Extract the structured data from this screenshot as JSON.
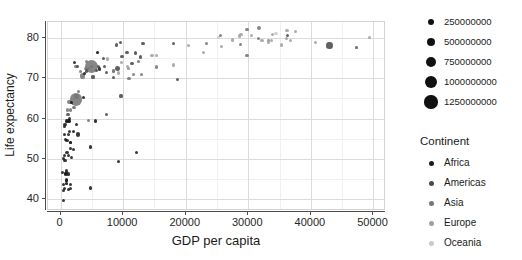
{
  "chart_data": {
    "type": "scatter",
    "title": "",
    "xlabel": "GDP per capita",
    "ylabel": "Life expectancy",
    "xlim": [
      -2000,
      52000
    ],
    "ylim": [
      37,
      84
    ],
    "xticks": [
      0,
      10000,
      20000,
      30000,
      40000,
      50000
    ],
    "xtick_labels": [
      "0",
      "10000",
      "20000",
      "30000",
      "40000",
      "50000"
    ],
    "yticks": [
      40,
      50,
      60,
      70,
      80
    ],
    "ytick_labels": [
      "40",
      "50",
      "60",
      "70",
      "80"
    ],
    "grid": true,
    "minor_grid": true,
    "legend_position": "right",
    "size_encoding": "population",
    "color_encoding": "continent",
    "series": [
      {
        "name": "Africa",
        "color": "#1a1a1a",
        "points": [
          {
            "x": 975,
            "y": 43.8,
            "pop": 31889923
          },
          {
            "x": 5937,
            "y": 76.4,
            "pop": 3600523
          },
          {
            "x": 6223,
            "y": 72.3,
            "pop": 33333216
          },
          {
            "x": 4797,
            "y": 42.7,
            "pop": 12420476
          },
          {
            "x": 1441,
            "y": 56.7,
            "pop": 8078314
          },
          {
            "x": 1217,
            "y": 50.7,
            "pop": 14326203
          },
          {
            "x": 430,
            "y": 50.0,
            "pop": 8390505
          },
          {
            "x": 2042,
            "y": 52.3,
            "pop": 17696293
          },
          {
            "x": 706,
            "y": 49.6,
            "pop": 4369038
          },
          {
            "x": 1704,
            "y": 50.4,
            "pop": 10238807
          },
          {
            "x": 986,
            "y": 44.7,
            "pop": 710960
          },
          {
            "x": 277,
            "y": 46.5,
            "pop": 64606759
          },
          {
            "x": 3632,
            "y": 65.2,
            "pop": 3800610
          },
          {
            "x": 1544,
            "y": 54.1,
            "pop": 18013409
          },
          {
            "x": 2082,
            "y": 56.7,
            "pop": 496374
          },
          {
            "x": 5581,
            "y": 59.4,
            "pop": 80264543
          },
          {
            "x": 12154,
            "y": 51.6,
            "pop": 551201
          },
          {
            "x": 641,
            "y": 58.0,
            "pop": 4906585
          },
          {
            "x": 690,
            "y": 42.6,
            "pop": 76511887
          },
          {
            "x": 1327,
            "y": 56.0,
            "pop": 1454867
          },
          {
            "x": 943,
            "y": 59.4,
            "pop": 1688359
          },
          {
            "x": 1454,
            "y": 60.0,
            "pop": 22873338
          },
          {
            "x": 575,
            "y": 56.0,
            "pop": 9947814
          },
          {
            "x": 863,
            "y": 46.4,
            "pop": 8860588
          },
          {
            "x": 1598,
            "y": 54.1,
            "pop": 35610177
          },
          {
            "x": 1544,
            "y": 42.6,
            "pop": 2012649
          },
          {
            "x": 469,
            "y": 42.1,
            "pop": 3193942
          },
          {
            "x": 1569,
            "y": 43.5,
            "pop": 19167654
          },
          {
            "x": 414,
            "y": 39.6,
            "pop": 12031795
          },
          {
            "x": 1042,
            "y": 54.5,
            "pop": 13327079
          },
          {
            "x": 895,
            "y": 44.6,
            "pop": 11746035
          },
          {
            "x": 1217,
            "y": 46.2,
            "pop": 1133066
          },
          {
            "x": 3820,
            "y": 71.2,
            "pop": 33757175
          },
          {
            "x": 823,
            "y": 54.8,
            "pop": 19951656
          },
          {
            "x": 4811,
            "y": 52.9,
            "pop": 2055080
          },
          {
            "x": 2749,
            "y": 56.0,
            "pop": 135031164
          },
          {
            "x": 863,
            "y": 46.2,
            "pop": 9319622
          },
          {
            "x": 1713,
            "y": 64.0,
            "pop": 12267493
          },
          {
            "x": 926,
            "y": 47.0,
            "pop": 85262356
          },
          {
            "x": 1441,
            "y": 59.4,
            "pop": 5866263
          },
          {
            "x": 9270,
            "y": 49.3,
            "pop": 43997828
          },
          {
            "x": 2602,
            "y": 58.6,
            "pop": 1688359
          },
          {
            "x": 722,
            "y": 58.6,
            "pop": 38139640
          },
          {
            "x": 1649,
            "y": 52.5,
            "pop": 5701579
          },
          {
            "x": 619,
            "y": 50.7,
            "pop": 40454
          },
          {
            "x": 2280,
            "y": 73.9,
            "pop": 10276158
          },
          {
            "x": 1044,
            "y": 51.5,
            "pop": 29170398
          },
          {
            "x": 1271,
            "y": 42.4,
            "pop": 11746035
          },
          {
            "x": 469,
            "y": 43.5,
            "pop": 12311143
          },
          {
            "x": 1201,
            "y": 59.4,
            "pop": 4553009
          }
        ]
      },
      {
        "name": "Americas",
        "color": "#4a4a4a",
        "points": [
          {
            "x": 12779,
            "y": 75.3,
            "pop": 40301927
          },
          {
            "x": 9666,
            "y": 65.6,
            "pop": 9119152
          },
          {
            "x": 9066,
            "y": 72.4,
            "pop": 190010647
          },
          {
            "x": 36319,
            "y": 80.7,
            "pop": 33390141
          },
          {
            "x": 13172,
            "y": 78.6,
            "pop": 16284741
          },
          {
            "x": 7007,
            "y": 72.9,
            "pop": 44227550
          },
          {
            "x": 9645,
            "y": 78.8,
            "pop": 4133884
          },
          {
            "x": 8948,
            "y": 78.3,
            "pop": 11416987
          },
          {
            "x": 6025,
            "y": 72.9,
            "pop": 9319622
          },
          {
            "x": 6873,
            "y": 75.0,
            "pop": 13755680
          },
          {
            "x": 5728,
            "y": 71.9,
            "pop": 6939688
          },
          {
            "x": 5186,
            "y": 70.3,
            "pop": 13572000
          },
          {
            "x": 7320,
            "y": 60.9,
            "pop": 8502814
          },
          {
            "x": 8458,
            "y": 70.2,
            "pop": 7483763
          },
          {
            "x": 1202,
            "y": 60.9,
            "pop": 8502814
          },
          {
            "x": 11978,
            "y": 76.2,
            "pop": 108700891
          },
          {
            "x": 2749,
            "y": 72.9,
            "pop": 5675356
          },
          {
            "x": 9809,
            "y": 75.5,
            "pop": 3242173
          },
          {
            "x": 4172,
            "y": 71.8,
            "pop": 6667147
          },
          {
            "x": 7408,
            "y": 71.4,
            "pop": 28674757
          },
          {
            "x": 18008,
            "y": 78.7,
            "pop": 3942491
          },
          {
            "x": 18678,
            "y": 69.8,
            "pop": 1056608
          },
          {
            "x": 10611,
            "y": 76.4,
            "pop": 3447496
          },
          {
            "x": 42951,
            "y": 78.2,
            "pop": 301139947
          },
          {
            "x": 11415,
            "y": 73.7,
            "pop": 26084662
          }
        ]
      },
      {
        "name": "Asia",
        "color": "#757575",
        "points": [
          {
            "x": 974,
            "y": 43.8,
            "pop": 31889923
          },
          {
            "x": 29796,
            "y": 75.6,
            "pop": 708573
          },
          {
            "x": 1391,
            "y": 64.1,
            "pop": 150448339
          },
          {
            "x": 12934,
            "y": 71.0,
            "pop": 3600523
          },
          {
            "x": 4959,
            "y": 72.9,
            "pop": 14131858
          },
          {
            "x": 4959,
            "y": 72.9,
            "pop": 1318683096
          },
          {
            "x": 29796,
            "y": 82.2,
            "pop": 6980412
          },
          {
            "x": 2452,
            "y": 64.7,
            "pop": 1110396331
          },
          {
            "x": 3541,
            "y": 70.6,
            "pop": 223547000
          },
          {
            "x": 11606,
            "y": 71.0,
            "pop": 69453570
          },
          {
            "x": 4471,
            "y": 59.5,
            "pop": 27499638
          },
          {
            "x": 25523,
            "y": 80.7,
            "pop": 6426679
          },
          {
            "x": 31656,
            "y": 82.6,
            "pop": 127467972
          },
          {
            "x": 4519,
            "y": 72.5,
            "pop": 6053193
          },
          {
            "x": 47307,
            "y": 77.6,
            "pop": 2505559
          },
          {
            "x": 23348,
            "y": 78.6,
            "pop": 49044790
          },
          {
            "x": 47307,
            "y": 77.6,
            "pop": 2505559
          },
          {
            "x": 10956,
            "y": 70.0,
            "pop": 3921278
          },
          {
            "x": 1091,
            "y": 62.1,
            "pop": 3393911
          },
          {
            "x": 12451,
            "y": 74.2,
            "pop": 24821286
          },
          {
            "x": 2042,
            "y": 62.7,
            "pop": 28901790
          },
          {
            "x": 2605,
            "y": 65.5,
            "pop": 165285100
          },
          {
            "x": 3190,
            "y": 71.7,
            "pop": 91077287
          },
          {
            "x": 15389,
            "y": 72.8,
            "pop": 27601038
          },
          {
            "x": 31656,
            "y": 79.97,
            "pop": 4553009
          },
          {
            "x": 3970,
            "y": 72.4,
            "pop": 20378239
          },
          {
            "x": 4184,
            "y": 74.1,
            "pop": 19314747
          },
          {
            "x": 28718,
            "y": 78.4,
            "pop": 23174294
          },
          {
            "x": 2874,
            "y": 66.8,
            "pop": 65068149
          },
          {
            "x": 1597,
            "y": 62.1,
            "pop": 1056608
          },
          {
            "x": 8458,
            "y": 71.8,
            "pop": 71158647
          },
          {
            "x": 2441,
            "y": 73.0,
            "pop": 85262356
          },
          {
            "x": 2281,
            "y": 62.7,
            "pop": 22211743
          }
        ]
      },
      {
        "name": "Europe",
        "color": "#a0a0a0",
        "points": [
          {
            "x": 5937,
            "y": 76.4,
            "pop": 3600523
          },
          {
            "x": 36126,
            "y": 79.8,
            "pop": 8199783
          },
          {
            "x": 33693,
            "y": 79.4,
            "pop": 10392226
          },
          {
            "x": 7446,
            "y": 74.8,
            "pop": 4552198
          },
          {
            "x": 10681,
            "y": 73.0,
            "pop": 7322858
          },
          {
            "x": 14619,
            "y": 75.7,
            "pop": 4493312
          },
          {
            "x": 22833,
            "y": 76.5,
            "pop": 10228744
          },
          {
            "x": 35278,
            "y": 78.3,
            "pop": 5468120
          },
          {
            "x": 33207,
            "y": 79.3,
            "pop": 5238460
          },
          {
            "x": 30470,
            "y": 80.7,
            "pop": 61083916
          },
          {
            "x": 32170,
            "y": 79.4,
            "pop": 82400996
          },
          {
            "x": 27538,
            "y": 79.5,
            "pop": 10706290
          },
          {
            "x": 18009,
            "y": 73.3,
            "pop": 9956108
          },
          {
            "x": 36180,
            "y": 81.8,
            "pop": 301931
          },
          {
            "x": 40676,
            "y": 78.9,
            "pop": 4109086
          },
          {
            "x": 28569,
            "y": 80.5,
            "pop": 58147733
          },
          {
            "x": 9254,
            "y": 71.3,
            "pop": 2780132
          },
          {
            "x": 33207,
            "y": 79.0,
            "pop": 3326498
          },
          {
            "x": 36798,
            "y": 79.3,
            "pop": 16570613
          },
          {
            "x": 49357,
            "y": 80.2,
            "pop": 4627926
          },
          {
            "x": 15389,
            "y": 75.6,
            "pop": 38518241
          },
          {
            "x": 20510,
            "y": 78.1,
            "pop": 10642836
          },
          {
            "x": 10808,
            "y": 72.5,
            "pop": 22276056
          },
          {
            "x": 10808,
            "y": 72.5,
            "pop": 9600000
          },
          {
            "x": 9786,
            "y": 74.0,
            "pop": 10150265
          },
          {
            "x": 25768,
            "y": 77.9,
            "pop": 2009245
          },
          {
            "x": 28821,
            "y": 80.9,
            "pop": 40448191
          },
          {
            "x": 33860,
            "y": 80.9,
            "pop": 9031088
          },
          {
            "x": 37506,
            "y": 81.7,
            "pop": 7554661
          },
          {
            "x": 8458,
            "y": 71.8,
            "pop": 71158647
          },
          {
            "x": 33203,
            "y": 79.4,
            "pop": 60776238
          }
        ]
      },
      {
        "name": "Oceania",
        "color": "#c9c9c9",
        "points": [
          {
            "x": 34435,
            "y": 81.2,
            "pop": 20434176
          },
          {
            "x": 25185,
            "y": 80.2,
            "pop": 4115771
          }
        ]
      }
    ]
  },
  "axes": {
    "x_title": "GDP per capita",
    "y_title": "Life expectancy"
  },
  "legend_size": {
    "items": [
      {
        "label": "250000000",
        "radius": 3.0
      },
      {
        "label": "500000000",
        "radius": 4.2
      },
      {
        "label": "750000000",
        "radius": 5.1
      },
      {
        "label": "1000000000",
        "radius": 5.9
      },
      {
        "label": "1250000000",
        "radius": 6.6
      }
    ]
  },
  "legend_continent": {
    "title": "Continent",
    "items": [
      {
        "label": "Africa",
        "color": "#1a1a1a"
      },
      {
        "label": "Americas",
        "color": "#4a4a4a"
      },
      {
        "label": "Asia",
        "color": "#757575"
      },
      {
        "label": "Europe",
        "color": "#a0a0a0"
      },
      {
        "label": "Oceania",
        "color": "#c9c9c9"
      }
    ]
  }
}
